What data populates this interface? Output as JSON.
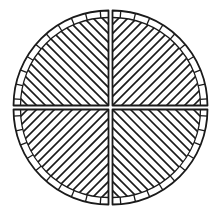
{
  "figure": {
    "background": "#ffffff",
    "stroke": "#1a1a1a",
    "canvas": {
      "width": 219,
      "height": 214
    },
    "center": {
      "x": 110.5,
      "y": 107.5
    },
    "outer_radius": 95,
    "inner_radius": 88,
    "gap": 4,
    "hatch_spacing": 9,
    "quadrants": [
      {
        "id": "top-left",
        "hatch": "backslash"
      },
      {
        "id": "top-right",
        "hatch": "slash"
      },
      {
        "id": "bottom-left",
        "hatch": "slash"
      },
      {
        "id": "bottom-right",
        "hatch": "backslash"
      }
    ]
  }
}
